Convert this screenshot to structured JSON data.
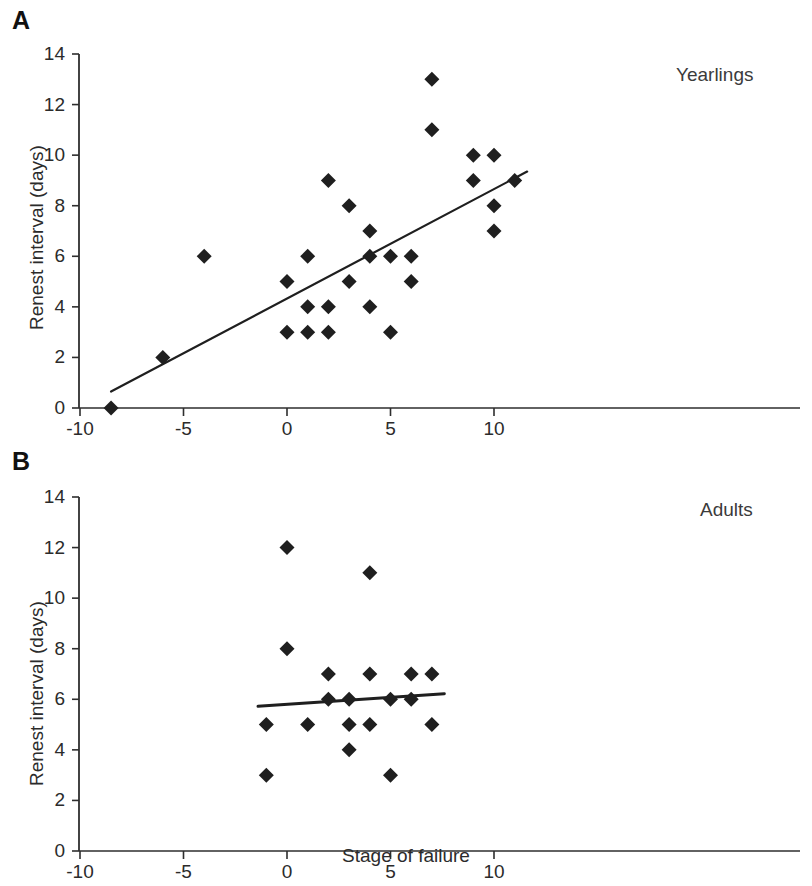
{
  "figure": {
    "xlabel": "Stage of failure",
    "ylabel": "Renest interval (days)",
    "panel_a_letter": "A",
    "panel_b_letter": "B"
  },
  "chart_data": [
    {
      "type": "scatter",
      "panel": "A",
      "title": "Yearlings",
      "xlabel": "",
      "ylabel": "Renest interval (days)",
      "xlim": [
        -10.5,
        13.2
      ],
      "ylim": [
        0,
        14
      ],
      "xticks": [
        -10,
        -5,
        0,
        5,
        10
      ],
      "xticklabels": [
        "-10",
        "-5",
        "0",
        "5",
        "10"
      ],
      "yticks": [
        0,
        2,
        4,
        6,
        8,
        10,
        12,
        14
      ],
      "yticklabels": [
        "0",
        "2",
        "4",
        "6",
        "8",
        "10",
        "12",
        "14"
      ],
      "grid": false,
      "legend": "none",
      "marker": "filled-diamond",
      "marker_color": "#1f1f1f",
      "points": [
        {
          "x": -8.5,
          "y": 0
        },
        {
          "x": -6.0,
          "y": 2
        },
        {
          "x": -4.0,
          "y": 6
        },
        {
          "x": 0.0,
          "y": 5
        },
        {
          "x": 0.0,
          "y": 3
        },
        {
          "x": 1.0,
          "y": 6
        },
        {
          "x": 1.0,
          "y": 4
        },
        {
          "x": 1.0,
          "y": 3
        },
        {
          "x": 2.0,
          "y": 9
        },
        {
          "x": 2.0,
          "y": 4
        },
        {
          "x": 2.0,
          "y": 3
        },
        {
          "x": 3.0,
          "y": 8
        },
        {
          "x": 3.0,
          "y": 5
        },
        {
          "x": 4.0,
          "y": 7
        },
        {
          "x": 4.0,
          "y": 6
        },
        {
          "x": 4.0,
          "y": 4
        },
        {
          "x": 5.0,
          "y": 6
        },
        {
          "x": 5.0,
          "y": 3
        },
        {
          "x": 6.0,
          "y": 6
        },
        {
          "x": 6.0,
          "y": 5
        },
        {
          "x": 7.0,
          "y": 13
        },
        {
          "x": 7.0,
          "y": 11
        },
        {
          "x": 9.0,
          "y": 10
        },
        {
          "x": 9.0,
          "y": 9
        },
        {
          "x": 10.0,
          "y": 10
        },
        {
          "x": 10.0,
          "y": 8
        },
        {
          "x": 10.0,
          "y": 7
        },
        {
          "x": 11.0,
          "y": 9
        }
      ],
      "fitline": {
        "x0": -8.5,
        "y0": 0.65,
        "x1": 11.6,
        "y1": 9.35
      }
    },
    {
      "type": "scatter",
      "panel": "B",
      "title": "Adults",
      "xlabel": "Stage of failure",
      "ylabel": "Renest interval (days)",
      "xlim": [
        -10.5,
        13.2
      ],
      "ylim": [
        0,
        14
      ],
      "xticks": [
        -10,
        -5,
        0,
        5,
        10
      ],
      "xticklabels": [
        "-10",
        "-5",
        "0",
        "5",
        "10"
      ],
      "yticks": [
        0,
        2,
        4,
        6,
        8,
        10,
        12,
        14
      ],
      "yticklabels": [
        "0",
        "2",
        "4",
        "6",
        "8",
        "10",
        "12",
        "14"
      ],
      "grid": false,
      "legend": "none",
      "marker": "filled-diamond",
      "marker_color": "#1f1f1f",
      "points": [
        {
          "x": -1.0,
          "y": 5
        },
        {
          "x": -1.0,
          "y": 3
        },
        {
          "x": 0.0,
          "y": 12
        },
        {
          "x": 0.0,
          "y": 8
        },
        {
          "x": 1.0,
          "y": 5
        },
        {
          "x": 2.0,
          "y": 7
        },
        {
          "x": 2.0,
          "y": 6
        },
        {
          "x": 3.0,
          "y": 6
        },
        {
          "x": 3.0,
          "y": 5
        },
        {
          "x": 3.0,
          "y": 4
        },
        {
          "x": 4.0,
          "y": 11
        },
        {
          "x": 4.0,
          "y": 7
        },
        {
          "x": 4.0,
          "y": 5
        },
        {
          "x": 5.0,
          "y": 6
        },
        {
          "x": 5.0,
          "y": 3
        },
        {
          "x": 6.0,
          "y": 7
        },
        {
          "x": 6.0,
          "y": 6
        },
        {
          "x": 7.0,
          "y": 7
        },
        {
          "x": 7.0,
          "y": 5
        }
      ],
      "fitline": {
        "x0": -1.4,
        "y0": 5.72,
        "x1": 7.6,
        "y1": 6.22
      }
    }
  ]
}
